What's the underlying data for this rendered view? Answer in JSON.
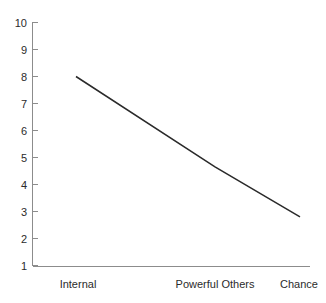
{
  "chart_data": {
    "type": "line",
    "title": "",
    "subtitle": "",
    "xlabel": "",
    "ylabel": "",
    "categories": [
      "Internal",
      "Powerful Others",
      "Chance"
    ],
    "series": [
      {
        "name": "",
        "values": [
          8.0,
          4.65,
          2.8
        ]
      }
    ],
    "ylim": [
      1,
      10
    ],
    "yticks": [
      1,
      2,
      3,
      4,
      5,
      6,
      7,
      8,
      9,
      10
    ],
    "ytick_labels": [
      "1",
      "2",
      "3",
      "4",
      "5",
      "6",
      "7",
      "8",
      "9",
      "10"
    ],
    "grid": false,
    "legend": false,
    "legend_position": "none",
    "annotations": [],
    "colors": {
      "line": "#2a2a2a",
      "axis": "#8c8c8c",
      "text": "#2b2b2b",
      "background": "#ffffff"
    }
  }
}
